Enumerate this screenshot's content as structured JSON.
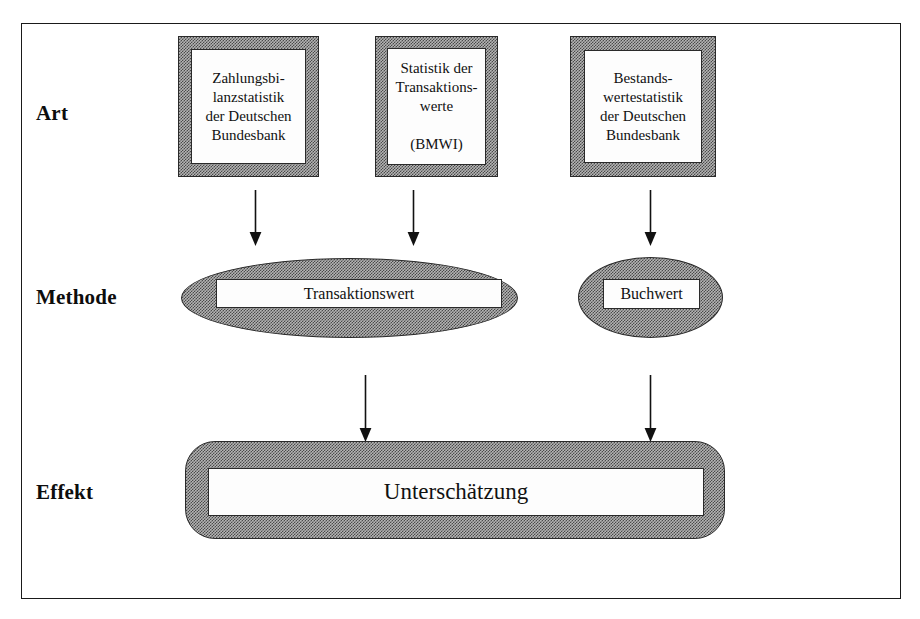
{
  "figure": {
    "shade_color": "#b4b4b4",
    "line_color": "#1a1a1a",
    "fill_color": "#fdfdfd"
  },
  "row_labels": [
    {
      "key": "art",
      "label": "Art"
    },
    {
      "key": "methode",
      "label": "Methode"
    },
    {
      "key": "effekt",
      "label": "Effekt"
    }
  ],
  "art_row": {
    "boxes": [
      {
        "id": "zahlungsbilanz",
        "text": "Zahlungsbi-\nlanzstatistik\nder Deutschen\nBundesbank"
      },
      {
        "id": "transaktionswerte",
        "text": "Statistik der\nTransaktions-\nwerte\n\n(BMWI)"
      },
      {
        "id": "bestandswerte",
        "text": "Bestands-\nwertestatistik\nder Deutschen\nBundesbank"
      }
    ]
  },
  "methode_row": {
    "shapes": [
      {
        "id": "transaktionswert",
        "shape": "ellipse",
        "text": "Transaktionswert"
      },
      {
        "id": "buchwert",
        "shape": "ellipse",
        "text": "Buchwert"
      }
    ]
  },
  "effekt_row": {
    "shape": {
      "id": "unterschaetzung",
      "shape": "rounded-rect",
      "text": "Unterschätzung"
    }
  },
  "arrows": [
    {
      "id": "arrow-zahlungsbilanz-to-transaktionswert",
      "from": "zahlungsbilanz",
      "to": "transaktionswert",
      "direction": "down"
    },
    {
      "id": "arrow-transaktionswerte-to-transaktionswert",
      "from": "transaktionswerte",
      "to": "transaktionswert",
      "direction": "down"
    },
    {
      "id": "arrow-bestandswerte-to-buchwert",
      "from": "bestandswerte",
      "to": "buchwert",
      "direction": "down"
    },
    {
      "id": "arrow-transaktionswert-to-unterschaetzung",
      "from": "transaktionswert",
      "to": "unterschaetzung",
      "direction": "down"
    },
    {
      "id": "arrow-buchwert-to-unterschaetzung",
      "from": "buchwert",
      "to": "unterschaetzung",
      "direction": "down"
    }
  ]
}
